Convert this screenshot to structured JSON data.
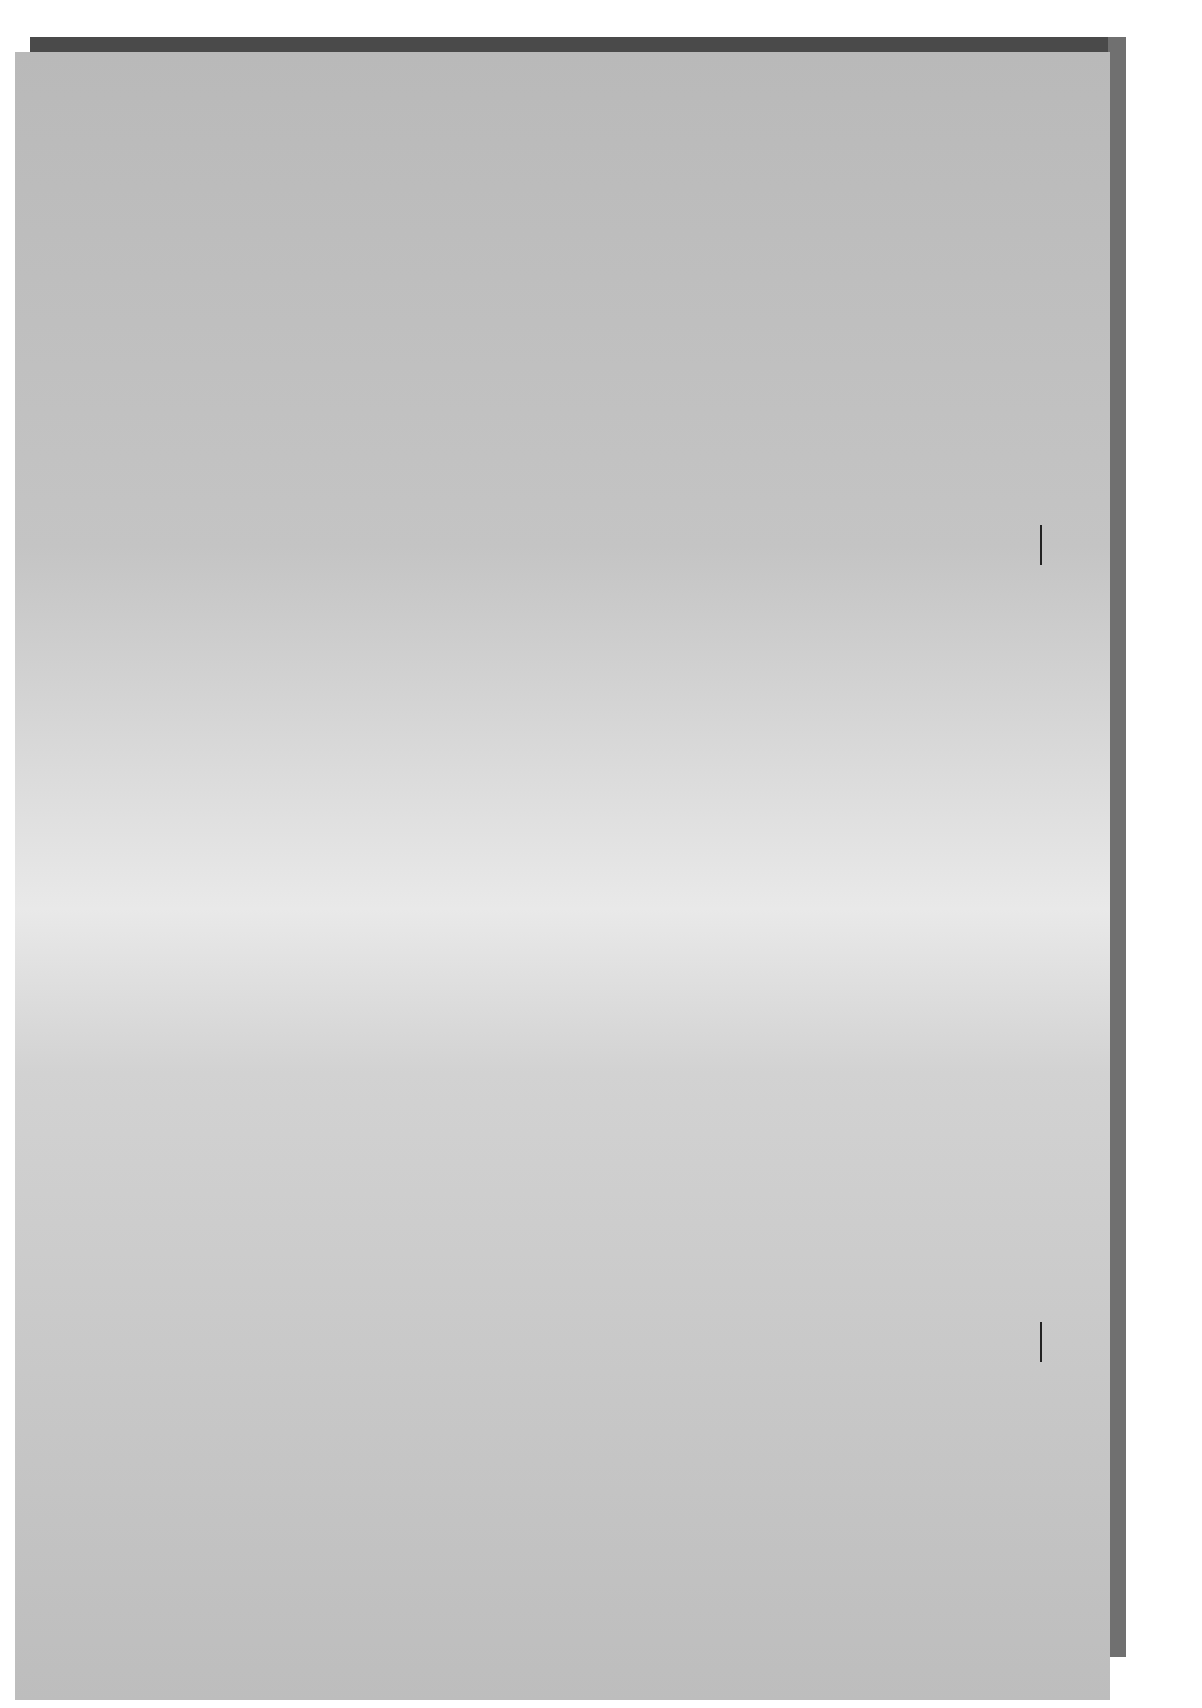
{
  "figure": {
    "label": "FIGURE 46-1",
    "cropped_caption_fragment": "g"
  },
  "leadership": {
    "commissioners": [
      "Commissioner",
      "Commissioner",
      "Commissioner",
      "Commissioner"
    ],
    "chairman": "Chairman",
    "executive_director": "Executive\nDirector"
  },
  "divisions": [
    "Inter-\nnational\nAffairs",
    "General\nCounsel",
    "Market\nRegulation",
    "Invest-\nment\nManage-\nment",
    "Enforce-\nment",
    "Corp-\noration\nFinance",
    "Secretary",
    "Public\nAffairs,\nPolicy\nEvaluation\nand\nResearch",
    "Inspector\nGeneral",
    "Economic\nAnalysis",
    "Chief\nAccountant",
    "Admin-\nistrative\nLaw\nJudges"
  ],
  "support_offices": [
    "Human\nResources\nManage-\nment",
    "Admin-\nistrative\nService",
    "Information\nTechnology",
    "Comp-\ntroller",
    "Filings\nInformation\nand\nConsumer\nServices"
  ],
  "regional_offices": [
    "Seattle",
    "Philadelphia",
    "New York",
    "Los\nAngeles",
    "Fort Worth",
    "Denver",
    "Chicago",
    "Boston",
    "Atlanta"
  ],
  "legend": {
    "budget_management": "Lines of budget and management authority",
    "policy_judicial": "Lines of policy and judicial authority"
  }
}
